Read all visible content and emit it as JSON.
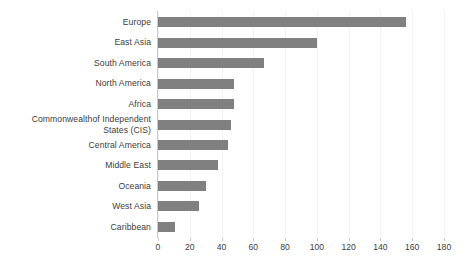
{
  "chart_data": {
    "type": "bar",
    "orientation": "horizontal",
    "title": "",
    "subtitle": "",
    "xlabel": "",
    "ylabel": "",
    "xlim": [
      0,
      180
    ],
    "xticks": [
      0,
      20,
      40,
      60,
      80,
      100,
      120,
      140,
      160,
      180
    ],
    "grid": true,
    "grid_axis": "x",
    "legend": false,
    "legend_position": "none",
    "bar_color": "#808080",
    "gridline_color": "#f2f2f2",
    "axis_color": "#c9c9c9",
    "text_color": "#3d3d3d",
    "categories": [
      "Europe",
      "East Asia",
      "South America",
      "North America",
      "Africa",
      "Commonwealthof Independent\nStates (CIS)",
      "Central America",
      "Middle East",
      "Oceania",
      "West Asia",
      "Caribbean"
    ],
    "values": [
      156,
      100,
      67,
      48,
      48,
      46,
      44,
      38,
      30,
      26,
      11
    ]
  }
}
